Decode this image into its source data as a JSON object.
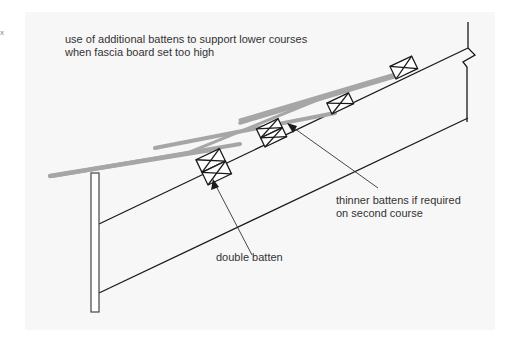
{
  "figure": {
    "title_lines": [
      "use of additional battens to support lower courses",
      "when fascia board set too high"
    ],
    "corner_mark": "x"
  },
  "annotations": {
    "thinner_battens": [
      "thinner battens if required",
      "on second course"
    ],
    "double_batten": "double batten"
  },
  "colors": {
    "panel": "#f7f7f7",
    "tile": "#a6a6a6",
    "line": "#1a1a1a",
    "text": "#333333"
  }
}
